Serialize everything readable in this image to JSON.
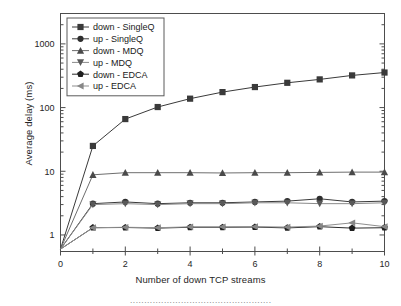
{
  "chart_data": {
    "type": "line",
    "title": "",
    "xlabel": "Number of down TCP streams",
    "ylabel": "Average delay (ms)",
    "xlim": [
      0,
      10
    ],
    "ylim": [
      0.55,
      3000
    ],
    "yscale": "log",
    "xscale": "linear",
    "grid": false,
    "legend_position": "top-left",
    "xticks": [
      "0",
      "2",
      "4",
      "6",
      "8",
      "10"
    ],
    "xtick_values": [
      0,
      2,
      4,
      6,
      8,
      10
    ],
    "xminor_values": [
      1,
      3,
      5,
      7,
      9
    ],
    "yticks": [
      "1",
      "10",
      "100",
      "1000"
    ],
    "ytick_values": [
      1,
      10,
      100,
      1000
    ],
    "x": [
      0,
      1,
      2,
      3,
      4,
      5,
      6,
      7,
      8,
      9,
      10
    ],
    "series": [
      {
        "name": "down - SingleQ",
        "marker": "square",
        "marker_color": "#3a3a3a",
        "line_color": "#3a3a3a",
        "values": [
          0.6,
          25,
          66,
          102,
          138,
          175,
          210,
          245,
          277,
          320,
          355
        ]
      },
      {
        "name": "up - SingleQ",
        "marker": "circle",
        "marker_color": "#2e2e2e",
        "line_color": "#3a3a3a",
        "values": [
          0.6,
          3.1,
          3.3,
          3.1,
          3.2,
          3.2,
          3.3,
          3.4,
          3.7,
          3.3,
          3.4
        ]
      },
      {
        "name": "down - MDQ",
        "marker": "triangle-up",
        "marker_color": "#4a4a4a",
        "line_color": "#6e6e6e",
        "values": [
          0.6,
          8.8,
          9.5,
          9.5,
          9.5,
          9.4,
          9.5,
          9.5,
          9.6,
          9.7,
          9.7
        ]
      },
      {
        "name": "up - MDQ",
        "marker": "triangle-down",
        "marker_color": "#595959",
        "line_color": "#8a8a8a",
        "values": [
          0.6,
          3.0,
          3.1,
          3.0,
          3.1,
          3.1,
          3.2,
          3.2,
          3.1,
          3.1,
          3.2
        ]
      },
      {
        "name": "down - EDCA",
        "marker": "pentagon",
        "marker_color": "#1f1f1f",
        "line_color": "#2b2b2b",
        "values": [
          0.6,
          1.3,
          1.31,
          1.28,
          1.32,
          1.32,
          1.33,
          1.29,
          1.35,
          1.28,
          1.3
        ]
      },
      {
        "name": "up - EDCA",
        "marker": "triangle-left",
        "marker_color": "#878787",
        "line_color": "#8f8f8f",
        "values": [
          0.6,
          1.3,
          1.32,
          1.3,
          1.34,
          1.34,
          1.35,
          1.33,
          1.38,
          1.55,
          1.35
        ]
      }
    ]
  },
  "caption": {
    "text": "··················································"
  },
  "colors": {
    "frame": "#4d4d4d",
    "background": "#ffffff",
    "text": "#262626"
  }
}
